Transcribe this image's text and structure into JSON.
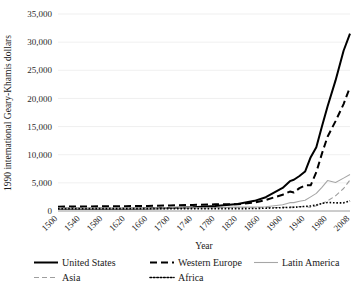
{
  "chart_data": {
    "type": "line",
    "title": "",
    "xlabel": "Year",
    "ylabel": "1990 international Geary-Khamis dollars",
    "xlim": [
      1500,
      2008
    ],
    "ylim": [
      0,
      35000
    ],
    "grid": true,
    "legend_position": "bottom",
    "ytick_labels": [
      "35,000",
      "30,000",
      "25,000",
      "20,000",
      "15,000",
      "10,000",
      "5,000",
      "0"
    ],
    "ytick_values": [
      35000,
      30000,
      25000,
      20000,
      15000,
      10000,
      5000,
      0
    ],
    "xtick_labels": [
      "1500",
      "1540",
      "1580",
      "1620",
      "1660",
      "1700",
      "1740",
      "1780",
      "1820",
      "1860",
      "1900",
      "1940",
      "1980",
      "2008"
    ],
    "xtick_values": [
      1500,
      1540,
      1580,
      1620,
      1660,
      1700,
      1740,
      1780,
      1820,
      1860,
      1900,
      1940,
      1980,
      2008
    ],
    "x": [
      1500,
      1540,
      1580,
      1620,
      1660,
      1700,
      1740,
      1780,
      1820,
      1850,
      1870,
      1900,
      1913,
      1920,
      1930,
      1940,
      1950,
      1960,
      1970,
      1980,
      1990,
      2000,
      2008
    ],
    "series": [
      {
        "name": "United States",
        "style": "solid",
        "color": "#000000",
        "width": 2.0,
        "values": [
          400,
          400,
          400,
          400,
          450,
          527,
          650,
          900,
          1257,
          1806,
          2445,
          4091,
          5301,
          5552,
          6213,
          7010,
          9561,
          11328,
          15030,
          18577,
          23201,
          28467,
          31500
        ]
      },
      {
        "name": "Western Europe",
        "style": "dashed",
        "color": "#000000",
        "width": 2.0,
        "values": [
          771,
          800,
          830,
          860,
          900,
          997,
          1080,
          1180,
          1202,
          1513,
          1960,
          2885,
          3457,
          3299,
          4065,
          4562,
          4569,
          6896,
          10195,
          13197,
          15965,
          19002,
          22000
        ]
      },
      {
        "name": "Latin America",
        "style": "solid",
        "color": "#a6a6a6",
        "width": 1.1,
        "values": [
          416,
          420,
          425,
          430,
          440,
          527,
          560,
          600,
          691,
          720,
          760,
          1113,
          1481,
          1493,
          1728,
          1900,
          2506,
          3136,
          4184,
          5412,
          5055,
          5838,
          6480
        ]
      },
      {
        "name": "Asia",
        "style": "dashed-thin",
        "color": "#9e9e9e",
        "width": 1.1,
        "values": [
          572,
          575,
          575,
          575,
          575,
          572,
          572,
          572,
          581,
          585,
          600,
          639,
          696,
          695,
          760,
          780,
          635,
          950,
          1350,
          1800,
          2700,
          4000,
          5500
        ]
      },
      {
        "name": "Africa",
        "style": "dotted",
        "color": "#000000",
        "width": 1.6,
        "values": [
          414,
          415,
          415,
          416,
          418,
          421,
          425,
          430,
          420,
          440,
          500,
          601,
          637,
          660,
          750,
          820,
          890,
          1063,
          1335,
          1515,
          1449,
          1447,
          1800
        ]
      }
    ]
  },
  "legend": {
    "entries": [
      {
        "label": "United States",
        "swatch": "solid-thick"
      },
      {
        "label": "Western Europe",
        "swatch": "dashed-thick"
      },
      {
        "label": "Latin America",
        "swatch": "solid-thin-gray"
      },
      {
        "label": "Asia",
        "swatch": "dashed-thin-gray"
      },
      {
        "label": "Africa",
        "swatch": "dotted"
      }
    ]
  }
}
